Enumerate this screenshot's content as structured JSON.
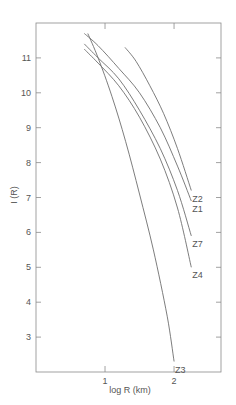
{
  "chart_data": {
    "type": "line",
    "title": "",
    "xlabel": "log R (km)",
    "ylabel": "I (R)",
    "xlim": [
      0.0,
      2.68
    ],
    "ylim": [
      2.0,
      12.0
    ],
    "xticks": [
      1,
      2
    ],
    "yticks": [
      3,
      4,
      5,
      6,
      7,
      8,
      9,
      10,
      11
    ],
    "grid": false,
    "legend": "inline curve labels at right ends",
    "series": [
      {
        "name": "Z2",
        "x": [
          1.29,
          1.45,
          1.65,
          1.85,
          2.05,
          2.25
        ],
        "y": [
          11.3,
          10.9,
          10.2,
          9.4,
          8.4,
          7.2
        ]
      },
      {
        "name": "Z1",
        "x": [
          0.7,
          0.9,
          1.2,
          1.5,
          1.8,
          2.05,
          2.25
        ],
        "y": [
          11.7,
          11.35,
          10.7,
          10.0,
          9.0,
          7.9,
          6.9
        ]
      },
      {
        "name": "Z7",
        "x": [
          0.7,
          0.9,
          1.2,
          1.5,
          1.8,
          2.05,
          2.25
        ],
        "y": [
          11.4,
          11.0,
          10.4,
          9.5,
          8.4,
          7.2,
          5.9
        ]
      },
      {
        "name": "Z4",
        "x": [
          0.7,
          0.9,
          1.2,
          1.5,
          1.8,
          2.05,
          2.25
        ],
        "y": [
          11.25,
          10.85,
          10.2,
          9.3,
          8.1,
          6.7,
          5.0
        ]
      },
      {
        "name": "Z3",
        "x": [
          0.75,
          0.9,
          1.1,
          1.3,
          1.5,
          1.7,
          1.9,
          2.0
        ],
        "y": [
          11.7,
          11.0,
          9.9,
          8.6,
          7.1,
          5.5,
          3.6,
          2.3
        ]
      }
    ],
    "curve_labels": [
      "Z2",
      "Z1",
      "Z7",
      "Z4",
      "Z3"
    ]
  },
  "colors": {
    "axis": "#7a7a7a",
    "curve": "#6e6e6e",
    "text": "#555555"
  }
}
